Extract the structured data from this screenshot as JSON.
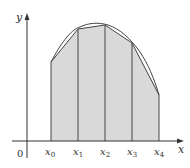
{
  "diagram": {
    "axes": {
      "x_label": "x",
      "y_label": "y",
      "origin_label": "0"
    },
    "points": [
      {
        "label": "x",
        "sub": "0",
        "px": 51,
        "top": 62
      },
      {
        "label": "x",
        "sub": "1",
        "px": 78,
        "top": 29
      },
      {
        "label": "x",
        "sub": "2",
        "px": 105,
        "top": 25
      },
      {
        "label": "x",
        "sub": "3",
        "px": 132,
        "top": 43
      },
      {
        "label": "x",
        "sub": "4",
        "px": 159,
        "top": 95
      }
    ],
    "colors": {
      "fill": "#d9d9d9",
      "stroke": "#444444",
      "axis": "#333333"
    }
  }
}
